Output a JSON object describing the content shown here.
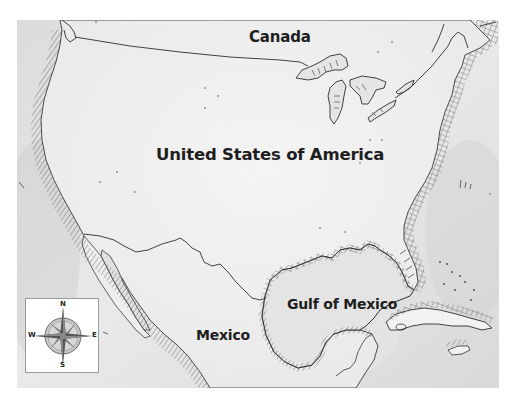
{
  "map": {
    "title": "",
    "labels": {
      "canada": "Canada",
      "usa": "United States of America",
      "gulf": "Gulf of Mexico",
      "mexico": "Mexico"
    },
    "compass": {
      "north": "N",
      "south": "S",
      "east": "E",
      "west": "W"
    },
    "colors": {
      "land": "#f1f1f1",
      "water": "#e2e2e2",
      "coast_shadow": "#b9b9b9",
      "line": "#3a3a3a",
      "text": "#1e1e1e"
    }
  }
}
